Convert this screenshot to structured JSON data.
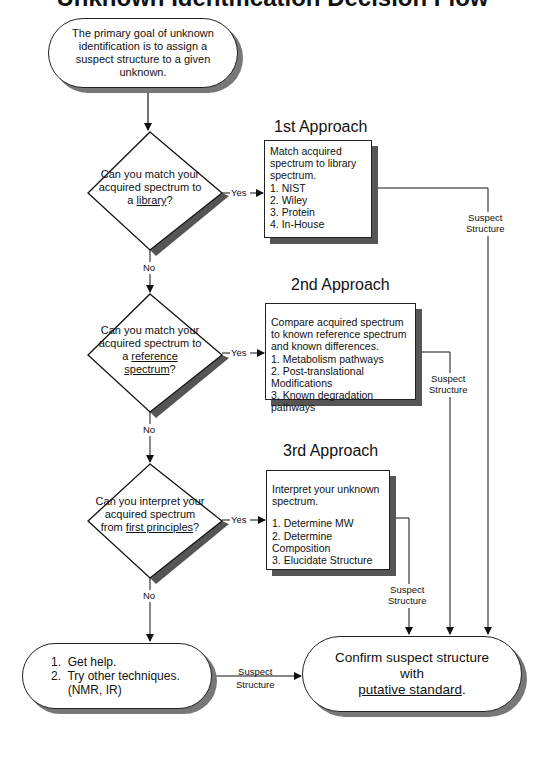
{
  "title": "Unknown Identification Decision Flow",
  "start": {
    "text": "The primary goal of unknown identification is to assign a suspect structure to a given unknown."
  },
  "approaches": [
    {
      "heading": "1st Approach",
      "question_pre": "Can you match your acquired spectrum to a",
      "question_link": "library",
      "question_post": "?",
      "yes_label": "Yes",
      "no_label": "No",
      "box_intro": "Match acquired spectrum to library spectrum.",
      "box_items": [
        "1.  NIST",
        "2.  Wiley",
        "3.  Protein",
        "4.  In-House"
      ],
      "output_label_1": "Suspect",
      "output_label_2": "Structure"
    },
    {
      "heading": "2nd Approach",
      "question_pre": "Can you match your acquired spectrum to a",
      "question_link": "reference spectrum",
      "question_post": "?",
      "yes_label": "Yes",
      "no_label": "No",
      "box_intro": "Compare acquired spectrum to known reference spectrum and known differences.",
      "box_items": [
        "1. Metabolism pathways",
        "2. Post-translational Modifications",
        "3. Known degradation pathways"
      ],
      "output_label_1": "Suspect",
      "output_label_2": "Structure"
    },
    {
      "heading": "3rd Approach",
      "question_pre": "Can you interpret your acquired spectrum from",
      "question_link": "first principles",
      "question_post": "?",
      "yes_label": "Yes",
      "no_label": "No",
      "box_intro": "Interpret your unknown spectrum.",
      "box_items": [
        "1.  Determine MW",
        "2.  Determine Composition",
        "3.  Elucidate Structure"
      ],
      "output_label_1": "Suspect",
      "output_label_2": "Structure"
    }
  ],
  "fallback": {
    "items": [
      "1.  Get help.",
      "2.  Try other techniques.",
      "     (NMR, IR)"
    ],
    "output_label_1": "Suspect",
    "output_label_2": "Structure"
  },
  "end": {
    "line1": "Confirm suspect structure",
    "line2": "with",
    "link": "putative standard",
    "suffix": "."
  }
}
